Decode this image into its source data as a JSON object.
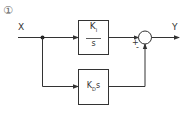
{
  "diagram": {
    "index_label": "①",
    "input_label": "X",
    "output_label": "Y",
    "upper_block": {
      "numerator": "K",
      "numerator_sub": "I",
      "denominator": "s"
    },
    "lower_block": {
      "gain": "K",
      "gain_sub": "D",
      "suffix": "s"
    },
    "summing_junction": {
      "upper_sign": "+",
      "lower_sign": "-"
    },
    "colors": {
      "line": "#333333",
      "background": "#ffffff"
    }
  }
}
